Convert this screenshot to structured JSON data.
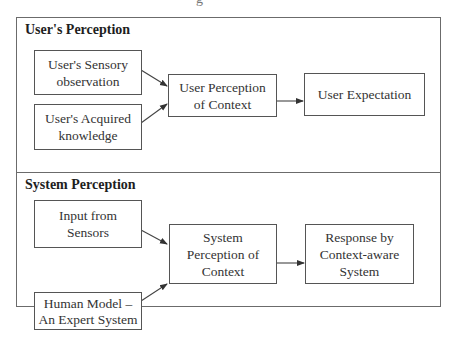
{
  "figure": {
    "cut_title_fragment": "g"
  },
  "sections": [
    {
      "title": "User's Perception",
      "boxes": [
        {
          "id": "sensory",
          "label": "User's Sensory observation"
        },
        {
          "id": "acquired",
          "label": "User's Acquired knowledge"
        },
        {
          "id": "user-perception",
          "label": "User Perception of Context"
        },
        {
          "id": "user-expectation",
          "label": "User Expectation"
        }
      ]
    },
    {
      "title": "System Perception",
      "boxes": [
        {
          "id": "sensors",
          "label": "Input from Sensors"
        },
        {
          "id": "system-perception",
          "label": "System Perception of Context"
        },
        {
          "id": "response",
          "label": "Response by Context-aware System"
        },
        {
          "id": "human-model",
          "label": "Human Model – An Expert System"
        }
      ]
    }
  ],
  "connections": [
    {
      "from": "sensory",
      "to": "user-perception"
    },
    {
      "from": "acquired",
      "to": "user-perception"
    },
    {
      "from": "user-perception",
      "to": "user-expectation"
    },
    {
      "from": "sensors",
      "to": "system-perception"
    },
    {
      "from": "human-model",
      "to": "system-perception"
    },
    {
      "from": "system-perception",
      "to": "response"
    }
  ],
  "colors": {
    "line": "#555555",
    "text": "#333333",
    "background": "#ffffff"
  }
}
